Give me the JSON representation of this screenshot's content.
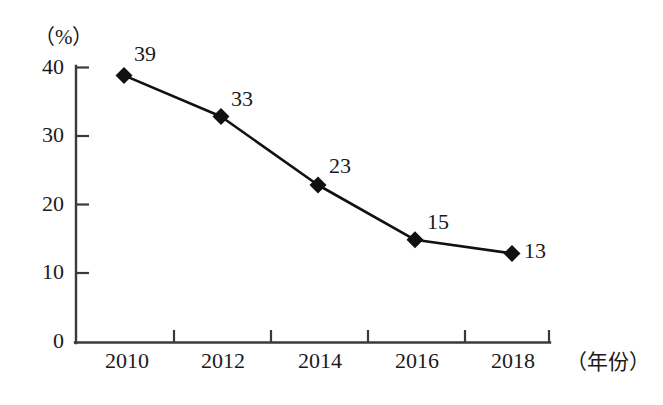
{
  "chart_data": {
    "type": "line",
    "title": "",
    "subtitle": "",
    "xlabel": "（年份）",
    "ylabel": "（%）",
    "categories": [
      "2010",
      "2012",
      "2014",
      "2016",
      "2018"
    ],
    "values": [
      39,
      33,
      23,
      15,
      13
    ],
    "point_labels": [
      "39",
      "33",
      "23",
      "15",
      "13"
    ],
    "y_ticks": [
      "40",
      "30",
      "20",
      "10",
      "0"
    ],
    "y_tick_values": [
      40,
      30,
      20,
      10,
      0
    ],
    "ylim": [
      0,
      40
    ],
    "grid": false,
    "legend": "none",
    "series": [
      {
        "name": "",
        "values": [
          39,
          33,
          23,
          15,
          13
        ],
        "marker": "diamond",
        "color": "#111111"
      }
    ],
    "colors": {
      "line": "#111111",
      "marker": "#111111",
      "axis": "#3a3a3a",
      "text": "#1a1a1a",
      "background": "#ffffff"
    }
  },
  "axes": {
    "y_unit": "（%）",
    "x_unit": "（年份）"
  },
  "ticks": {
    "y": [
      {
        "label": "40"
      },
      {
        "label": "30"
      },
      {
        "label": "20"
      },
      {
        "label": "10"
      },
      {
        "label": "0"
      }
    ],
    "x": [
      {
        "label": "2010"
      },
      {
        "label": "2012"
      },
      {
        "label": "2014"
      },
      {
        "label": "2016"
      },
      {
        "label": "2018"
      }
    ]
  },
  "points": [
    {
      "label": "39"
    },
    {
      "label": "33"
    },
    {
      "label": "23"
    },
    {
      "label": "15"
    },
    {
      "label": "13"
    }
  ]
}
